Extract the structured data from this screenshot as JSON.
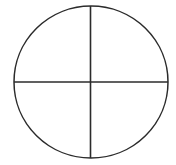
{
  "figure": {
    "background_color": "#ffffff",
    "stroke_color": "#2b2b2b",
    "stroke_width": 1.5,
    "canvas": {
      "width": 176,
      "height": 165
    },
    "circle": {
      "center_x": 91,
      "center_y": 82,
      "radius_x": 77,
      "radius_y": 76,
      "left": 14,
      "right": 168,
      "top": 6,
      "bottom": 158
    },
    "vertical_diameter": {
      "x": 90.5,
      "y_start": 6,
      "y_end": 158
    },
    "horizontal_diameter": {
      "y": 82,
      "x_start": 14,
      "x_end": 168
    },
    "quadrant_count": 4,
    "labels": []
  }
}
